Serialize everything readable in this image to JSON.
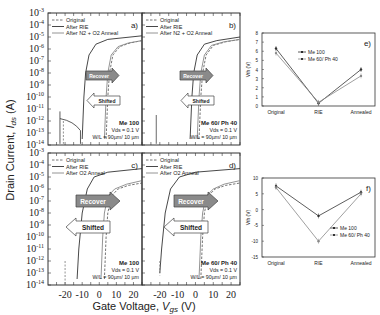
{
  "chart_data": [
    {
      "id": "a",
      "type": "line",
      "panel_label": "a)",
      "title": "",
      "xlabel": "Gate Voltage, Vgs (V)",
      "ylabel": "Drain Current, Ids (A)",
      "xlim": [
        -30,
        25
      ],
      "ylim_log10": [
        -14,
        -3
      ],
      "legend": [
        "Original",
        "After RIE",
        "After N2 + O2 Anneal"
      ],
      "annotation": [
        "Me 100",
        "Vds = 0.1 V",
        "W/L = 90µm/ 10 µm"
      ],
      "arrows": [
        "Recover",
        "Shifted"
      ],
      "series": [
        {
          "name": "Original",
          "style": "dashed",
          "x": [
            4,
            5,
            6,
            8,
            12,
            18,
            25
          ],
          "y_log10": [
            -13.5,
            -10,
            -8,
            -6.5,
            -5.8,
            -5.5,
            -5.3
          ]
        },
        {
          "name": "After RIE",
          "style": "solid",
          "x": [
            -10,
            -9,
            -8,
            -6,
            -2,
            5,
            25
          ],
          "y_log10": [
            -13.5,
            -10,
            -8,
            -6.5,
            -5.6,
            -5.2,
            -4.9
          ]
        },
        {
          "name": "After N2 + O2 Anneal",
          "style": "solid-light",
          "x": [
            3,
            4,
            5,
            7,
            11,
            17,
            25
          ],
          "y_log10": [
            -13.5,
            -10,
            -8,
            -6.5,
            -5.8,
            -5.5,
            -5.3
          ]
        }
      ]
    },
    {
      "id": "b",
      "type": "line",
      "panel_label": "b)",
      "legend": [
        "Original",
        "After RIE",
        "After N2 + O2 Anneal"
      ],
      "annotation": [
        "Me 60/ Ph 40",
        "Vds = 0.1 V",
        "W/L = 90µm/ 10 µm"
      ],
      "arrows": [
        "Recover",
        "Shifted"
      ],
      "xlim": [
        -30,
        25
      ],
      "ylim_log10": [
        -14,
        -3
      ],
      "series": [
        {
          "name": "Original",
          "style": "dashed",
          "x": [
            2,
            3,
            4,
            6,
            10,
            17,
            25
          ],
          "y_log10": [
            -13.5,
            -10,
            -8,
            -6.5,
            -5.7,
            -5.4,
            -5.2
          ]
        },
        {
          "name": "After RIE",
          "style": "solid",
          "x": [
            -3,
            -2,
            -1,
            1,
            5,
            12,
            25
          ],
          "y_log10": [
            -13.5,
            -10,
            -8,
            -6.5,
            -5.6,
            -5.3,
            -5.0
          ]
        },
        {
          "name": "After N2 + O2 Anneal",
          "style": "solid-light",
          "x": [
            1,
            2,
            3,
            5,
            9,
            16,
            25
          ],
          "y_log10": [
            -13.5,
            -10,
            -8,
            -6.5,
            -5.7,
            -5.4,
            -5.2
          ]
        }
      ]
    },
    {
      "id": "c",
      "type": "line",
      "panel_label": "c)",
      "legend": [
        "Original",
        "After RIE",
        "After O2 Anneal"
      ],
      "annotation": [
        "Me 100",
        "Vds = 0.1 V",
        "W/L = 90µm/ 10 µm"
      ],
      "arrows": [
        "Recover",
        "Shifted"
      ],
      "xlim": [
        -30,
        25
      ],
      "ylim_log10": [
        -14,
        -3
      ],
      "series": [
        {
          "name": "Original",
          "style": "dashed",
          "x": [
            3,
            4,
            5,
            7,
            11,
            17,
            25
          ],
          "y_log10": [
            -13.5,
            -10,
            -8,
            -6.6,
            -6,
            -5.7,
            -5.5
          ]
        },
        {
          "name": "After RIE",
          "style": "solid",
          "x": [
            -13,
            -12,
            -10,
            -7,
            -3,
            5,
            25
          ],
          "y_log10": [
            -13.5,
            -11,
            -8,
            -6,
            -5,
            -4.6,
            -4.3
          ]
        },
        {
          "name": "After O2 Anneal",
          "style": "solid-light",
          "x": [
            1,
            2,
            3,
            5,
            9,
            16,
            25
          ],
          "y_log10": [
            -13.5,
            -10,
            -8,
            -6.6,
            -6,
            -5.6,
            -5.3
          ]
        }
      ]
    },
    {
      "id": "d",
      "type": "line",
      "panel_label": "d)",
      "legend": [
        "Original",
        "After RIE",
        "After O2 Anneal"
      ],
      "annotation": [
        "Me 60/ Ph 40",
        "Vds = 0.1 V",
        "W/L = 90µm/ 10 µm"
      ],
      "arrows": [
        "Recover",
        "Shifted"
      ],
      "xlim": [
        -30,
        25
      ],
      "ylim_log10": [
        -14,
        -3
      ],
      "series": [
        {
          "name": "Original",
          "style": "dashed",
          "x": [
            3,
            4,
            5,
            7,
            11,
            17,
            25
          ],
          "y_log10": [
            -13.5,
            -10,
            -8,
            -6.6,
            -6,
            -5.7,
            -5.5
          ]
        },
        {
          "name": "After RIE",
          "style": "solid",
          "x": [
            -20,
            -19,
            -17,
            -14,
            -9,
            0,
            25
          ],
          "y_log10": [
            -13,
            -11,
            -8,
            -6,
            -5,
            -4.6,
            -4.3
          ]
        },
        {
          "name": "After O2 Anneal",
          "style": "solid-light",
          "x": [
            2,
            3,
            4,
            6,
            10,
            16,
            25
          ],
          "y_log10": [
            -13.5,
            -10,
            -8,
            -6.6,
            -6,
            -5.6,
            -5.3
          ]
        }
      ]
    },
    {
      "id": "e",
      "type": "line",
      "panel_label": "e)",
      "ylabel": "Vth (V)",
      "categories": [
        "Original",
        "RIE",
        "Annealed"
      ],
      "ylim": [
        0,
        8
      ],
      "yticks": [
        0,
        1,
        2,
        3,
        4,
        5,
        6,
        7,
        8
      ],
      "legend": [
        "Me 100",
        "Me 60/ Ph 40"
      ],
      "series": [
        {
          "name": "Me 100",
          "values": [
            6.3,
            0.3,
            4.0
          ]
        },
        {
          "name": "Me 60/ Ph 40",
          "values": [
            5.8,
            0.4,
            3.3
          ]
        }
      ]
    },
    {
      "id": "f",
      "type": "line",
      "panel_label": "f)",
      "ylabel": "Vth (V)",
      "categories": [
        "Original",
        "RIE",
        "Annealed"
      ],
      "ylim": [
        -15,
        10
      ],
      "yticks": [
        10,
        5,
        0,
        -5,
        -10,
        -15
      ],
      "legend": [
        "Me 100",
        "Me 60/ Ph 40"
      ],
      "series": [
        {
          "name": "Me 100",
          "values": [
            7.5,
            -2.0,
            5.5
          ]
        },
        {
          "name": "Me 60/ Ph 40",
          "values": [
            7.0,
            -10.0,
            5.0
          ]
        }
      ]
    }
  ],
  "labels": {
    "ylabel_main": "Drain Current, ",
    "ylabel_var": "I",
    "ylabel_sub": "ds",
    "ylabel_unit": " (A)",
    "xlabel_main": "Gate Voltage, ",
    "xlabel_var": "V",
    "xlabel_sub": "gs",
    "xlabel_unit": " (V)",
    "recover": "Recover",
    "shifted": "Shifted",
    "vth_label": "Vth (V)",
    "xticks": [
      "-20",
      "-10",
      "0",
      "10",
      "20"
    ],
    "yticks_exp": [
      "-3",
      "-4",
      "-5",
      "-6",
      "-7",
      "-8",
      "-9",
      "-10",
      "-11",
      "-12",
      "-13",
      "-14"
    ]
  }
}
